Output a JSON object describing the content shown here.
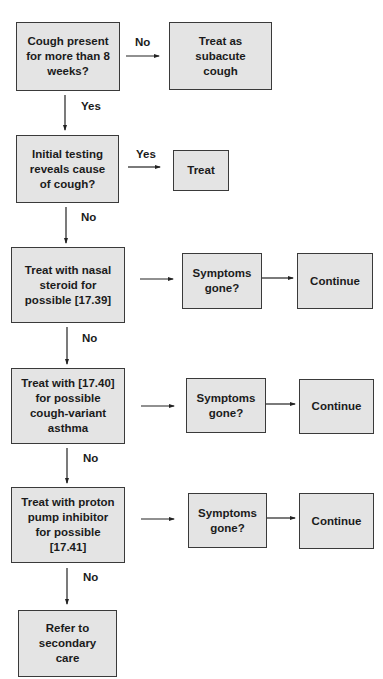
{
  "diagram": {
    "type": "flowchart",
    "colors": {
      "box_fill": "#e4e4e4",
      "box_border": "#3a3a3a",
      "text": "#1b1b1b",
      "arrow": "#222222"
    },
    "nodes": {
      "cough_duration": "Cough present\nfor more than 8\nweeks?",
      "subacute": "Treat as\nsubacute\ncough",
      "initial_testing": "Initial testing\nreveals cause\nof cough?",
      "treat": "Treat",
      "nasal_steroid": "Treat with nasal\nsteroid for\npossible [17.39]",
      "symptoms_1": "Symptoms\ngone?",
      "continue_1": "Continue",
      "asthma": "Treat with [17.40]\nfor possible\ncough-variant\nasthma",
      "symptoms_2": "Symptoms\ngone?",
      "continue_2": "Continue",
      "ppi": "Treat with proton\npump inhibitor\nfor possible\n[17.41]",
      "symptoms_3": "Symptoms\ngone?",
      "continue_3": "Continue",
      "refer": "Refer to\nsecondary\ncare"
    },
    "edge_labels": {
      "cough_no": "No",
      "cough_yes": "Yes",
      "testing_yes": "Yes",
      "testing_no": "No",
      "nasal_no": "No",
      "asthma_no": "No",
      "ppi_no": "No"
    },
    "edges": [
      {
        "from": "cough_duration",
        "to": "subacute",
        "label": "No"
      },
      {
        "from": "cough_duration",
        "to": "initial_testing",
        "label": "Yes"
      },
      {
        "from": "initial_testing",
        "to": "treat",
        "label": "Yes"
      },
      {
        "from": "initial_testing",
        "to": "nasal_steroid",
        "label": "No"
      },
      {
        "from": "nasal_steroid",
        "to": "symptoms_1",
        "label": ""
      },
      {
        "from": "symptoms_1",
        "to": "continue_1",
        "label": ""
      },
      {
        "from": "nasal_steroid",
        "to": "asthma",
        "label": "No"
      },
      {
        "from": "asthma",
        "to": "symptoms_2",
        "label": ""
      },
      {
        "from": "symptoms_2",
        "to": "continue_2",
        "label": ""
      },
      {
        "from": "asthma",
        "to": "ppi",
        "label": "No"
      },
      {
        "from": "ppi",
        "to": "symptoms_3",
        "label": ""
      },
      {
        "from": "symptoms_3",
        "to": "continue_3",
        "label": ""
      },
      {
        "from": "ppi",
        "to": "refer",
        "label": "No"
      }
    ]
  }
}
